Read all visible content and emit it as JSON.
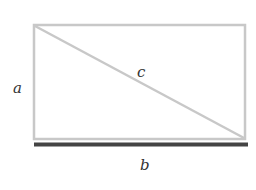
{
  "diagram": {
    "labels": {
      "side_a": "a",
      "side_b": "b",
      "diagonal_c": "c"
    },
    "colors": {
      "rectangle_stroke": "#c8c8c8",
      "diagonal_stroke": "#c8c8c8",
      "base_highlight": "#444444",
      "label_text": "#333333"
    }
  }
}
